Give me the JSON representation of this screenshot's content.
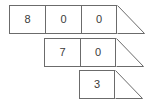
{
  "figure": {
    "title": "",
    "background_color": "#ffffff",
    "line_color": "#6b6b6b",
    "text_color": "#3a3a3a",
    "shape_type": "stair-step place-value cell diagram with right-triangle tail"
  },
  "rows": [
    {
      "id": "row-1",
      "indent_cells": 0,
      "cells": [
        {
          "value": "8"
        },
        {
          "value": "0"
        },
        {
          "value": "0"
        }
      ],
      "tail": "right-triangle"
    },
    {
      "id": "row-2",
      "indent_cells": 1,
      "cells": [
        {
          "value": "7"
        },
        {
          "value": "0"
        }
      ],
      "tail": "right-triangle"
    },
    {
      "id": "row-3",
      "indent_cells": 2,
      "cells": [
        {
          "value": "3"
        }
      ],
      "tail": "right-triangle"
    }
  ]
}
